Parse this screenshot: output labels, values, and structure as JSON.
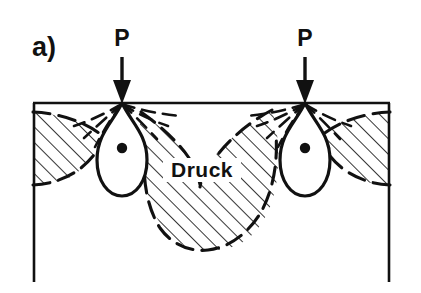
{
  "figure": {
    "panel_label": "a)",
    "zone_label": "Druck",
    "load_labels": [
      "P",
      "P"
    ],
    "colors": {
      "ink": "#111111",
      "background": "#ffffff",
      "hatch": "#111111",
      "dashed_contour": "#111111"
    }
  },
  "diagram": {
    "type": "stress-bulb-cross-section",
    "soil_block": {
      "surface_y": 103,
      "left_x": 33,
      "right_x": 390,
      "bottom_y": 282,
      "has_bottom_border": false
    },
    "loads": [
      {
        "name": "P",
        "label": "P",
        "x": 122,
        "arrow_top_y": 56,
        "arrow_tip_y": 103,
        "label_x": 122,
        "label_y": 46
      },
      {
        "name": "P",
        "label": "P",
        "x": 305,
        "arrow_top_y": 56,
        "arrow_tip_y": 103,
        "label_x": 305,
        "label_y": 46
      }
    ],
    "pressure_bulbs": [
      {
        "apex_x": 122,
        "apex_y": 103,
        "center_x": 122,
        "center_y": 150,
        "half_width": 25,
        "bottom_y": 196,
        "dot_x": 122,
        "dot_y": 148,
        "dot_r": 5
      },
      {
        "apex_x": 305,
        "apex_y": 103,
        "center_x": 305,
        "center_y": 150,
        "half_width": 25,
        "bottom_y": 196,
        "dot_x": 305,
        "dot_y": 148,
        "dot_r": 5
      }
    ],
    "hatched_regions": [
      {
        "name": "left-edge-compression-wedge",
        "hatch_angle_deg": 45
      },
      {
        "name": "central-compression-lobe",
        "hatch_angle_deg": 45
      },
      {
        "name": "right-edge-compression-wedge",
        "hatch_angle_deg": 45
      }
    ],
    "central_lobe": {
      "top_y": 112,
      "bottom_y": 250,
      "left_x": 152,
      "right_x": 272
    },
    "radiating_contours_per_load": 9,
    "contour_style": "dashed"
  }
}
